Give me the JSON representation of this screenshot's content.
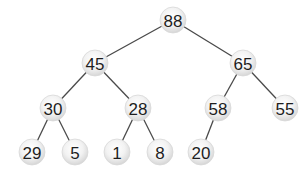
{
  "diagram": {
    "type": "binary-tree",
    "node_radius": 13,
    "colors": {
      "background": "#ffffff",
      "edge": "#4a4a4a",
      "node_fill_light": "#ffffff",
      "node_fill_dark": "#d6d6d6",
      "label": "#1e1e1e"
    },
    "nodes": [
      {
        "id": "n0",
        "label": "88",
        "x": 173,
        "y": 20
      },
      {
        "id": "n1",
        "label": "45",
        "x": 95,
        "y": 63
      },
      {
        "id": "n2",
        "label": "65",
        "x": 243,
        "y": 63
      },
      {
        "id": "n3",
        "label": "30",
        "x": 53,
        "y": 108
      },
      {
        "id": "n4",
        "label": "28",
        "x": 138,
        "y": 108
      },
      {
        "id": "n5",
        "label": "58",
        "x": 218,
        "y": 108
      },
      {
        "id": "n6",
        "label": "55",
        "x": 285,
        "y": 108
      },
      {
        "id": "n7",
        "label": "29",
        "x": 32,
        "y": 152
      },
      {
        "id": "n8",
        "label": "5",
        "x": 75,
        "y": 152
      },
      {
        "id": "n9",
        "label": "1",
        "x": 117,
        "y": 152
      },
      {
        "id": "n10",
        "label": "8",
        "x": 160,
        "y": 152
      },
      {
        "id": "n11",
        "label": "20",
        "x": 201,
        "y": 152
      }
    ],
    "edges": [
      {
        "from": "n0",
        "to": "n1"
      },
      {
        "from": "n0",
        "to": "n2"
      },
      {
        "from": "n1",
        "to": "n3"
      },
      {
        "from": "n1",
        "to": "n4"
      },
      {
        "from": "n2",
        "to": "n5"
      },
      {
        "from": "n2",
        "to": "n6"
      },
      {
        "from": "n3",
        "to": "n7"
      },
      {
        "from": "n3",
        "to": "n8"
      },
      {
        "from": "n4",
        "to": "n9"
      },
      {
        "from": "n4",
        "to": "n10"
      },
      {
        "from": "n5",
        "to": "n11"
      }
    ]
  }
}
